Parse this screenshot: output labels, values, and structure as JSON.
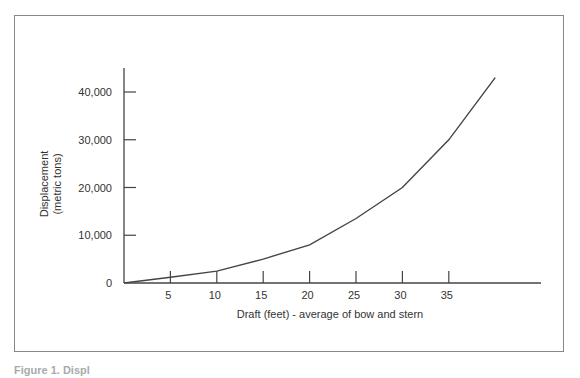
{
  "chart_data": {
    "type": "line",
    "title": "",
    "xlabel": "Draft (feet) - average of bow and stern",
    "ylabel": "Displacement (metric tons)",
    "ylabel_lines": [
      "Displacement",
      "(metric tons)"
    ],
    "x_ticks": [
      "5",
      "10",
      "15",
      "20",
      "25",
      "30",
      "35"
    ],
    "y_ticks": [
      "0",
      "10,000",
      "20,000",
      "30,000",
      "40,000"
    ],
    "xlim": [
      0,
      43
    ],
    "ylim": [
      0,
      45000
    ],
    "grid": false,
    "legend": null,
    "series": [
      {
        "name": "Displacement",
        "x": [
          0,
          5,
          10,
          15,
          20,
          25,
          30,
          35,
          40
        ],
        "values": [
          0,
          1200,
          2500,
          5000,
          8000,
          13500,
          20000,
          30000,
          43000
        ]
      }
    ]
  },
  "caption": "Figure 1. Displ"
}
